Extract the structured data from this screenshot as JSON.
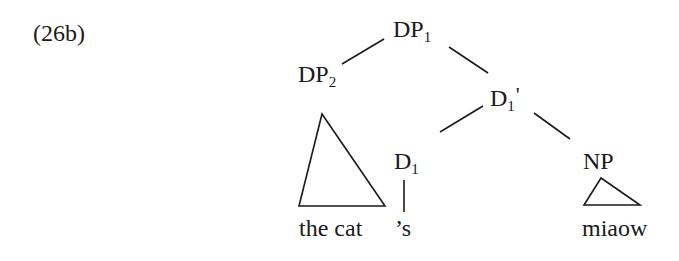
{
  "example_label": "(26b)",
  "tree": {
    "nodes": {
      "dp1": {
        "category": "DP",
        "index": "1",
        "prime": ""
      },
      "dp2": {
        "category": "DP",
        "index": "2",
        "prime": ""
      },
      "d1bar": {
        "category": "D",
        "index": "1",
        "prime": "'"
      },
      "d1": {
        "category": "D",
        "index": "1",
        "prime": ""
      },
      "np": {
        "category": "NP",
        "index": "",
        "prime": ""
      }
    },
    "leaves": {
      "dp2_text": "the cat",
      "d1_text": "’s",
      "np_text": "miaow"
    },
    "structure": "[DP1 [DP2 the cat] [D1' [D1 's] [NP miaow]]]"
  }
}
